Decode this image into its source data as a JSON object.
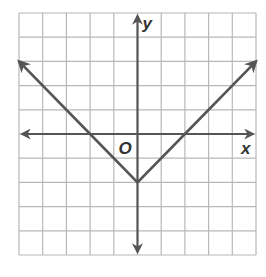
{
  "chart_data": {
    "type": "line",
    "title": "",
    "xlabel": "x",
    "ylabel": "y",
    "origin_label": "O",
    "xlim": [
      -5,
      5
    ],
    "ylim": [
      -5,
      5
    ],
    "grid": true,
    "tick_labels": false,
    "function": "y = |x| - 2",
    "series": [
      {
        "name": "y = |x| - 2",
        "x": [
          -5,
          -2,
          0,
          2,
          5
        ],
        "y": [
          3,
          0,
          -2,
          0,
          3
        ],
        "arrows_at_ends": true
      }
    ],
    "vertex": [
      0,
      -2
    ],
    "x_intercepts": [
      -2,
      2
    ],
    "y_intercept": -2
  },
  "colors": {
    "grid": "#b8b8b8",
    "axis": "#555555",
    "line": "#555555",
    "background": "#ffffff"
  }
}
